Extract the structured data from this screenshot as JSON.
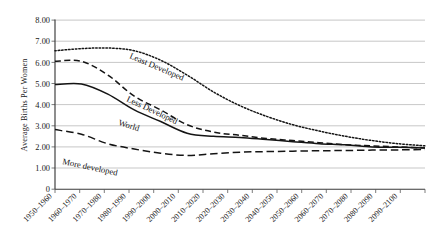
{
  "chart_data": {
    "type": "line",
    "title": "",
    "xlabel": "",
    "ylabel": "Average Births Per Women",
    "ylim": [
      0,
      8
    ],
    "yticks": [
      "0",
      "1.00",
      "2.00",
      "3.00",
      "4.00",
      "5.00",
      "6.00",
      "7.00",
      "8.00"
    ],
    "grid": true,
    "legend_position": "inline-annotations",
    "categories": [
      "1950–1960",
      "1960–1970",
      "1970–1980",
      "1980–1990",
      "1990–2000",
      "2000–2010",
      "2010–2020",
      "2020–2030",
      "2030–2040",
      "2040–2050",
      "2050–2060",
      "2060–2070",
      "2070–2080",
      "2080–2090",
      "2090–2100"
    ],
    "series": [
      {
        "name": "Least Developed",
        "style": "dotted",
        "values": [
          6.55,
          6.65,
          6.68,
          6.55,
          6.1,
          5.4,
          4.6,
          3.95,
          3.45,
          3.05,
          2.75,
          2.5,
          2.3,
          2.15,
          2.05
        ]
      },
      {
        "name": "Less Developed",
        "style": "dashed",
        "values": [
          6.05,
          6.05,
          5.4,
          4.4,
          3.75,
          3.05,
          2.7,
          2.55,
          2.4,
          2.3,
          2.2,
          2.1,
          2.05,
          2.0,
          1.95
        ]
      },
      {
        "name": "World",
        "style": "solid",
        "values": [
          4.95,
          4.98,
          4.5,
          3.75,
          3.2,
          2.65,
          2.5,
          2.45,
          2.35,
          2.25,
          2.15,
          2.1,
          2.0,
          1.98,
          1.95
        ]
      },
      {
        "name": "More developed",
        "style": "long-dash",
        "values": [
          2.82,
          2.6,
          2.15,
          1.9,
          1.7,
          1.6,
          1.68,
          1.75,
          1.78,
          1.8,
          1.82,
          1.83,
          1.85,
          1.86,
          1.88
        ]
      }
    ],
    "annotations": [
      {
        "text": "Least Developed",
        "for": "Least Developed"
      },
      {
        "text": "Less Developed",
        "for": "Less Developed"
      },
      {
        "text": "World",
        "for": "World"
      },
      {
        "text": "More developed",
        "for": "More developed"
      }
    ]
  }
}
